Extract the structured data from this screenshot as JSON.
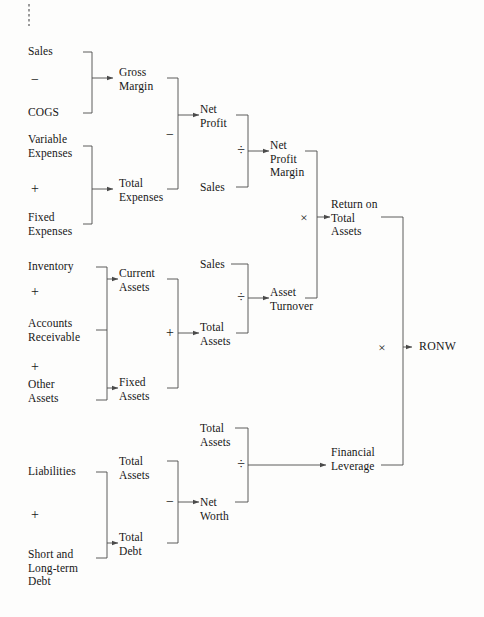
{
  "diagram": {
    "background": "#fdfdfc",
    "line_color": "#4a4a4a",
    "text_color": "#171717",
    "crop_mark": "dashed-vertical-tick",
    "nodes": {
      "sales_1": "Sales",
      "cogs": "COGS",
      "gross_margin": "Gross\nMargin",
      "variable_expenses": "Variable\nExpenses",
      "fixed_expenses": "Fixed\nExpenses",
      "total_expenses": "Total\nExpenses",
      "net_profit": "Net\nProfit",
      "sales_2": "Sales",
      "net_profit_margin": "Net\nProfit\nMargin",
      "inventory": "Inventory",
      "accounts_receivable": "Accounts\nReceivable",
      "other_assets": "Other\nAssets",
      "current_assets": "Current\nAssets",
      "fixed_assets": "Fixed\nAssets",
      "total_assets_1": "Total\nAssets",
      "sales_3": "Sales",
      "total_assets_2": "Total\nAssets",
      "asset_turnover": "Asset\nTurnover",
      "return_on_total_assets": "Return on\nTotal\nAssets",
      "liabilities": "Liabilities",
      "short_long_term_debt": "Short and\nLong-term\nDebt",
      "total_assets_3": "Total\nAssets",
      "total_debt": "Total\nDebt",
      "net_worth": "Net\nWorth",
      "total_assets_4": "Total\nAssets",
      "financial_leverage": "Financial\nLeverage",
      "ronw": "RONW"
    },
    "operators": {
      "minus_sales_cogs": "−",
      "plus_expenses": "+",
      "minus_gross_total": "−",
      "div_net_profit_sales": "÷",
      "plus_assets": "+",
      "div_sales_assets": "÷",
      "times_margin_turnover": "×",
      "plus_liabilities": "+",
      "minus_assets_debt": "−",
      "div_assets_networth": "÷",
      "times_rota_leverage": "×"
    }
  }
}
